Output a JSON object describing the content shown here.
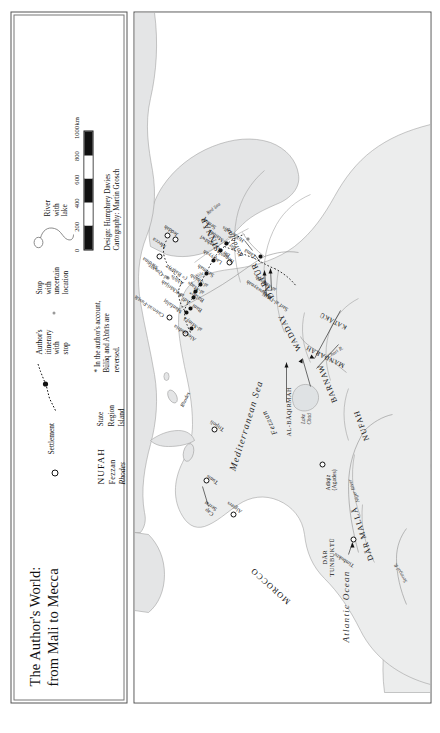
{
  "legend": {
    "title": "The Author's World:\nfrom Mali to Mecca",
    "items": [
      {
        "symbol": "settlement-circle",
        "label": "Settlement"
      },
      {
        "symbol": "itinerary-line-with-stop",
        "label": "Author's\nitinerary\nwith stop"
      },
      {
        "symbol": "uncertain-dot",
        "label": "Stop with\nuncertain\nlocation"
      },
      {
        "symbol": "river-with-lake",
        "label": "River with\nlake"
      }
    ],
    "typography_key": [
      {
        "sample": "NUFAH",
        "label": "State"
      },
      {
        "sample": "Fezzan",
        "label": "Region"
      },
      {
        "sample": "Rhodes",
        "label": "Island"
      }
    ],
    "note": "* In the author's account,\nBūlāq and Abīrīs are\nreversed.",
    "scale": {
      "ticks": [
        "0",
        "200",
        "400",
        "600",
        "800",
        "1000"
      ],
      "units": "km"
    },
    "credits": "Design: Humphrey Davies\nCartography: Martin Grosch"
  },
  "map": {
    "oceans": [
      {
        "name": "Mediterranean Sea",
        "x": 232,
        "y": 92,
        "rot": 17,
        "size": 9.6
      },
      {
        "name": "Atlantic Ocean",
        "x": 60,
        "y": 206,
        "rot": 0,
        "size": 9.2
      },
      {
        "name": "Red Sea",
        "x": 489,
        "y": 70,
        "rot": 52,
        "size": 5.0
      }
    ],
    "states": [
      {
        "name": "MOROCCO",
        "x": 100,
        "y": 150,
        "rot": -48,
        "size": 8.4,
        "spacing": 1.1
      },
      {
        "name": "DĀR MALLĀ",
        "x": 142,
        "y": 232,
        "rot": -18,
        "size": 8.0,
        "spacing": 1.0
      },
      {
        "name": "DĀR\nTUNBUKTŪ",
        "x": 126,
        "y": 186,
        "rot": 0,
        "size": 6.2,
        "spacing": 0.6
      },
      {
        "name": "NUFAH",
        "x": 262,
        "y": 228,
        "rot": -20,
        "size": 8.0,
        "spacing": 1.0
      },
      {
        "name": "BARNAW",
        "x": 300,
        "y": 196,
        "rot": -22,
        "size": 8.0,
        "spacing": 1.0
      },
      {
        "name": "MANDARAH",
        "x": 336,
        "y": 206,
        "rot": -64,
        "size": 6.4,
        "spacing": 0.6
      },
      {
        "name": "KATĀKŪ",
        "x": 374,
        "y": 208,
        "rot": -62,
        "size": 6.4,
        "spacing": 0.6
      },
      {
        "name": "AL-BĀQIRMAH",
        "x": 300,
        "y": 152,
        "rot": 0,
        "size": 6.2,
        "spacing": 0.5
      },
      {
        "name": "WADDAY",
        "x": 352,
        "y": 160,
        "rot": -28,
        "size": 8.0,
        "spacing": 1.0
      },
      {
        "name": "DĀRFŪR",
        "x": 404,
        "y": 133,
        "rot": -28,
        "size": 8.4,
        "spacing": 1.0
      },
      {
        "name": "SINNĀR",
        "x": 452,
        "y": 79,
        "rot": -24,
        "size": 8.4,
        "spacing": 1.0
      }
    ],
    "regions": [
      {
        "name": "Fezzan",
        "x": 268,
        "y": 136,
        "rot": -26,
        "size": 7.6
      },
      {
        "name": "Kordofan",
        "x": 446,
        "y": 103,
        "rot": -26,
        "size": 7.0
      }
    ],
    "islands": [
      {
        "name": "Rhodes",
        "x": 296,
        "y": 42,
        "rot": 26,
        "size": 5.4
      }
    ],
    "rivers": [
      {
        "name": "Nile",
        "x": 433,
        "y": 57,
        "rot": 62
      },
      {
        "name": "Niger River",
        "x": 208,
        "y": 219,
        "rot": -24
      },
      {
        "name": "Senegal R.",
        "x": 128,
        "y": 268,
        "rot": -30
      },
      {
        "name": "Chari R.",
        "x": 352,
        "y": 185,
        "rot": 58
      },
      {
        "name": "Lake\nChad",
        "x": 292,
        "y": 172,
        "rot": 0
      }
    ],
    "settlements": [
      {
        "name": "Timbuktu",
        "x": 160,
        "y": 218,
        "lx": 136,
        "ly": 214,
        "rot": -58,
        "type": "open"
      },
      {
        "name": "Adīqiz\n(Agades)",
        "x": 235,
        "y": 187,
        "lx": 216,
        "ly": 192,
        "rot": 0,
        "type": "open"
      },
      {
        "name": "Algiers",
        "x": 185,
        "y": 98,
        "lx": 189,
        "ly": 104,
        "rot": -56,
        "type": "open"
      },
      {
        "name": "Tunis",
        "x": 219,
        "y": 71,
        "lx": 219,
        "ly": 80,
        "rot": -58,
        "type": "open"
      },
      {
        "name": "Cap\nSerrat",
        "x": 222,
        "y": 66,
        "lx": 196,
        "ly": 72,
        "rot": -56,
        "type": "none"
      },
      {
        "name": "Tripoli",
        "x": 270,
        "y": 79,
        "lx": 272,
        "ly": 86,
        "rot": -56,
        "type": "open"
      },
      {
        "name": "Alexandria",
        "x": 369,
        "y": 48,
        "lx": 364,
        "ly": 56,
        "rot": -56,
        "type": "open"
      },
      {
        "name": "Cairo/al-Fusṭāṭ",
        "x": 381,
        "y": 30,
        "lx": 384,
        "ly": 26,
        "rot": -56,
        "type": "open"
      },
      {
        "name": "al-Quṣayr",
        "x": 423,
        "y": 30,
        "lx": 424,
        "ly": 28,
        "rot": -56,
        "type": "uncertain"
      },
      {
        "name": "al-Khārijah",
        "x": 405,
        "y": 42,
        "lx": 406,
        "ly": 44,
        "rot": -56,
        "type": "uncertain"
      },
      {
        "name": "Medina",
        "x": 443,
        "y": 22,
        "lx": 438,
        "ly": 18,
        "rot": -56,
        "type": "open"
      },
      {
        "name": "Mecca",
        "x": 464,
        "y": 30,
        "lx": 458,
        "ly": 28,
        "rot": -56,
        "type": "open"
      },
      {
        "name": "Jeddah",
        "x": 460,
        "y": 36,
        "lx": 468,
        "ly": 38,
        "rot": -56,
        "type": "open"
      },
      {
        "name": "Dongola",
        "x": 437,
        "y": 92,
        "lx": 440,
        "ly": 96,
        "rot": -56,
        "type": "open"
      },
      {
        "name": "Sennar",
        "x": 470,
        "y": 86,
        "lx": 474,
        "ly": 78,
        "rot": -56,
        "type": "none"
      }
    ],
    "itinerary_stops": [
      {
        "name": "al-Minyā",
        "x": 379,
        "y": 55,
        "lx": 376,
        "ly": 62,
        "rot": -56
      },
      {
        "name": "Manfalūṭ",
        "x": 389,
        "y": 50,
        "lx": 390,
        "ly": 46,
        "rot": -56
      },
      {
        "name": "Banī ʿAdī",
        "x": 392,
        "y": 57,
        "lx": 392,
        "ly": 63,
        "rot": -56
      },
      {
        "name": "Būlāq*",
        "x": 404,
        "y": 58,
        "lx": 403,
        "ly": 64,
        "rot": -56
      },
      {
        "name": "al-Maqs",
        "x": 409,
        "y": 59,
        "lx": 411,
        "ly": 64,
        "rot": -56
      },
      {
        "name": "Abīrīs\n(= Baḥrī)*",
        "x": 420,
        "y": 48,
        "lx": 424,
        "ly": 44,
        "rot": -56
      },
      {
        "name": "al-Shabb",
        "x": 415,
        "y": 64,
        "lx": 417,
        "ly": 68,
        "rot": -56
      },
      {
        "name": "Salīmah",
        "x": 425,
        "y": 70,
        "lx": 427,
        "ly": 74,
        "rot": -56
      },
      {
        "name": "Laqiyyah",
        "x": 438,
        "y": 77,
        "lx": 440,
        "ly": 82,
        "rot": -56
      },
      {
        "name": "Bir al-Zaghāwī",
        "x": 450,
        "y": 84,
        "lx": 449,
        "ly": 90,
        "rot": -56
      },
      {
        "name": "Bir al-Malḥah",
        "x": 456,
        "y": 90,
        "lx": 456,
        "ly": 96,
        "rot": -56
      },
      {
        "name": "al-Suwaynah",
        "x": 438,
        "y": 128,
        "lx": 412,
        "ly": 133,
        "rot": -56
      },
      {
        "name": "al-Mazrūb",
        "x": 443,
        "y": 133,
        "lx": 420,
        "ly": 136,
        "rot": -56
      },
      {
        "name": "Sarf al-Dājāj",
        "x": 432,
        "y": 141,
        "lx": 400,
        "ly": 146,
        "rot": -56
      },
      {
        "name": "Tāmä",
        "x": 452,
        "y": 122,
        "lx": 448,
        "ly": 118,
        "rot": -56
      },
      {
        "name": "Hillat Jalīs",
        "x": 462,
        "y": 112,
        "lx": 462,
        "ly": 106,
        "rot": -56
      }
    ]
  }
}
